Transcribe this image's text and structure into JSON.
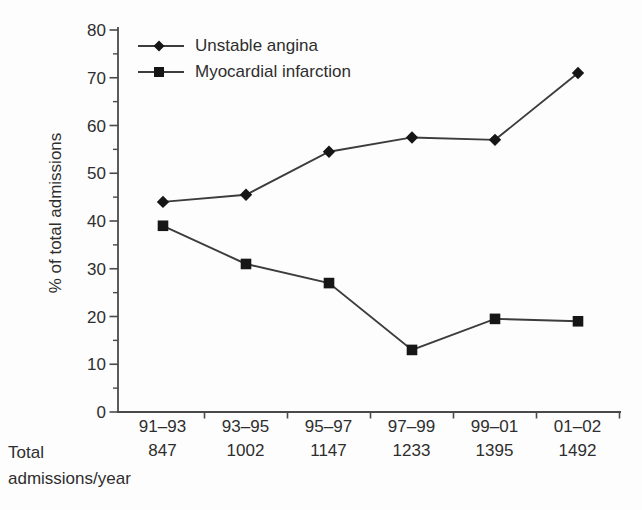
{
  "figure": {
    "background": "#fdfdfd",
    "ink_color": "#161616",
    "line_color": "#3c3c3c",
    "axis_color": "#4a4a4a",
    "text_color": "#2e2e2e"
  },
  "chart_data": {
    "type": "line",
    "title": "",
    "xlabel": "",
    "ylabel": "% of total admissions",
    "ylim": [
      0,
      80
    ],
    "yticks": [
      0,
      10,
      20,
      30,
      40,
      50,
      60,
      70,
      80
    ],
    "ytick_minor_step": 5,
    "grid": false,
    "legend_position": "top-left",
    "categories": [
      "91–93",
      "93–95",
      "95–97",
      "97–99",
      "99–01",
      "01–02"
    ],
    "series": [
      {
        "name": "Unstable angina",
        "marker": "diamond",
        "values": [
          44,
          45.5,
          54.5,
          57.5,
          57,
          71
        ]
      },
      {
        "name": "Myocardial infarction",
        "marker": "square",
        "values": [
          39,
          31,
          27,
          13,
          19.5,
          19
        ]
      }
    ],
    "totals": {
      "label_line1": "Total",
      "label_line2": "admissions/year",
      "values": [
        "847",
        "1002",
        "1147",
        "1233",
        "1395",
        "1492"
      ]
    }
  }
}
